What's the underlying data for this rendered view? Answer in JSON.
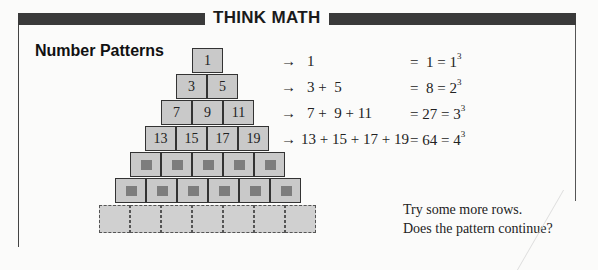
{
  "header": {
    "title": "THINK MATH"
  },
  "section": {
    "title": "Number Patterns"
  },
  "pyramid": {
    "rows": [
      [
        "1"
      ],
      [
        "3",
        "5"
      ],
      [
        "7",
        "9",
        "11"
      ],
      [
        "13",
        "15",
        "17",
        "19"
      ]
    ],
    "hidden_rows": [
      5,
      6
    ],
    "dashed_row_count": 7
  },
  "equations": [
    {
      "arrow": "→",
      "lhs": "1",
      "sum": "=  1 = 1",
      "exp": "3"
    },
    {
      "arrow": "→",
      "lhs": "3 +  5",
      "sum": "=  8 = 2",
      "exp": "3"
    },
    {
      "arrow": "→",
      "lhs": "7 +  9 + 11",
      "sum": "= 27 = 3",
      "exp": "3"
    },
    {
      "arrow": "→",
      "lhs": "13 + 15 + 17 + 19",
      "sum": "= 64 = 4",
      "exp": "3"
    }
  ],
  "prompt": {
    "line1": "Try some more rows.",
    "line2": "Does the pattern continue?"
  },
  "colors": {
    "box": "#c9c9c9",
    "bar": "#3a3a3a",
    "hidden_square": "#7d7d7d"
  }
}
